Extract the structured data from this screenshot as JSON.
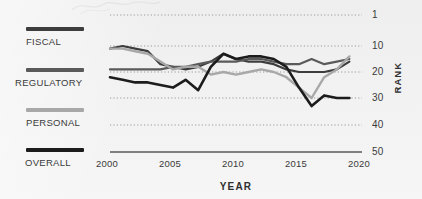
{
  "chart_data": {
    "type": "line",
    "title": "",
    "xlabel": "YEAR",
    "ylabel": "RANK",
    "xlim": [
      2000,
      2020
    ],
    "ylim": [
      1,
      50
    ],
    "y_inverted": true,
    "grid": "horizontal-dotted",
    "legend_position": "left",
    "x_ticks": [
      "2000",
      "2005",
      "2010",
      "2015",
      "2020"
    ],
    "x_tick_values": [
      2000,
      2005,
      2010,
      2015,
      2020
    ],
    "y_ticks": [
      "1",
      "10",
      "20",
      "30",
      "40",
      "50"
    ],
    "y_tick_values": [
      1,
      10,
      20,
      30,
      40,
      50
    ],
    "x": [
      2000,
      2001,
      2002,
      2003,
      2004,
      2005,
      2006,
      2007,
      2008,
      2009,
      2010,
      2011,
      2012,
      2013,
      2014,
      2015,
      2016,
      2017,
      2018,
      2019
    ],
    "series": [
      {
        "name": "FISCAL",
        "color": "#3d3d3d",
        "width": 2.2,
        "values": [
          11,
          10,
          11,
          12,
          17,
          18,
          19,
          18,
          16,
          13,
          15,
          16,
          16,
          17,
          19,
          20,
          20,
          20,
          19,
          16
        ]
      },
      {
        "name": "REGULATORY",
        "color": "#5a5a5a",
        "width": 2.2,
        "values": [
          19,
          19,
          19,
          19,
          19,
          18,
          18,
          17,
          16,
          16,
          16,
          15,
          15,
          16,
          17,
          17,
          15,
          17,
          16,
          15
        ]
      },
      {
        "name": "PERSONAL",
        "color": "#a8a8a8",
        "width": 2.4,
        "values": [
          11,
          11,
          12,
          13,
          16,
          19,
          18,
          18,
          21,
          20,
          21,
          20,
          19,
          20,
          22,
          26,
          30,
          22,
          19,
          14
        ]
      },
      {
        "name": "OVERALL",
        "color": "#1c1c1c",
        "width": 2.6,
        "values": [
          22,
          23,
          24,
          24,
          25,
          26,
          23,
          27,
          18,
          13,
          15,
          14,
          14,
          15,
          18,
          26,
          33,
          29,
          30,
          30
        ]
      }
    ]
  },
  "legend": {
    "items": [
      {
        "label": "FISCAL",
        "color": "#3d3d3d"
      },
      {
        "label": "REGULATORY",
        "color": "#5a5a5a"
      },
      {
        "label": "PERSONAL",
        "color": "#a8a8a8"
      },
      {
        "label": "OVERALL",
        "color": "#1c1c1c"
      }
    ]
  },
  "axes": {
    "y_title": "RANK",
    "x_title": "YEAR",
    "y_tick_1": "1",
    "y_tick_10": "10",
    "y_tick_20": "20",
    "y_tick_30": "30",
    "y_tick_40": "40",
    "y_tick_50": "50",
    "x_tick_2000": "2000",
    "x_tick_2005": "2005",
    "x_tick_2010": "2010",
    "x_tick_2015": "2015",
    "x_tick_2020": "2020"
  },
  "colors": {
    "background": "#efefef",
    "axis": "#555555",
    "grid": "#9a9a9a",
    "text": "#3a3a3a"
  }
}
